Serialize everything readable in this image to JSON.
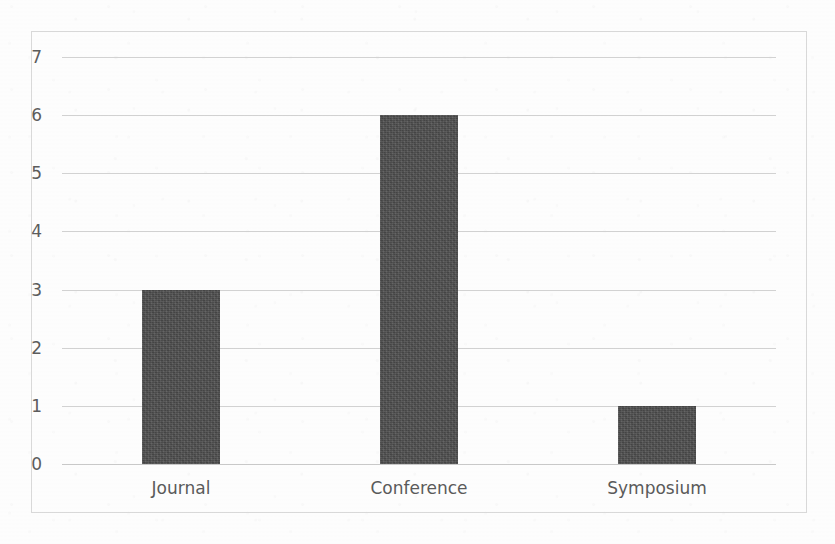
{
  "chart_data": {
    "type": "bar",
    "title": "",
    "subtitle": "",
    "xlabel": "",
    "ylabel": "",
    "categories": [
      "Journal",
      "Conference",
      "Symposium"
    ],
    "values": [
      3,
      6,
      1
    ],
    "series": [
      {
        "name": "Publications",
        "values": [
          3,
          6,
          1
        ]
      }
    ],
    "ylim": [
      0,
      7
    ],
    "y_ticks": [
      7,
      6,
      5,
      4,
      3,
      2,
      1,
      0
    ],
    "y_tick_labels": [
      "7",
      "6",
      "5",
      "4",
      "3",
      "2",
      "1",
      "0"
    ],
    "grid": true,
    "grid_axis": "y",
    "legend": false,
    "legend_position": "none",
    "annotations": [],
    "colors": {
      "bar": "#4d4d4d",
      "gridline": "#d2d2d2",
      "frame": "#d9d9d9",
      "tick_label": "#5c5c5c",
      "category_label": "#5a5a5a",
      "background": "#fdfdfd"
    }
  }
}
